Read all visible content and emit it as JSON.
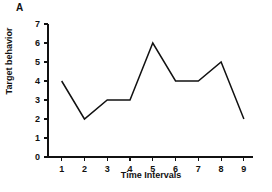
{
  "figure": {
    "panel_label": "A"
  },
  "chart_data": {
    "type": "line",
    "title": "",
    "subtitle": "",
    "xlabel": "Time Intervals",
    "ylabel": "Target behavior",
    "x": [
      1,
      2,
      3,
      4,
      5,
      6,
      7,
      8,
      9
    ],
    "values": [
      4,
      2,
      3,
      3,
      6,
      4,
      4,
      5,
      2
    ],
    "xtick_labels": [
      "1",
      "2",
      "3",
      "4",
      "5",
      "6",
      "7",
      "8",
      "9"
    ],
    "ytick_labels": [
      "0",
      "1",
      "2",
      "3",
      "4",
      "5",
      "6",
      "7"
    ],
    "ytick_values": [
      0,
      1,
      2,
      3,
      4,
      5,
      6,
      7
    ],
    "xlim": [
      0.4,
      9.4
    ],
    "ylim": [
      0,
      7
    ],
    "grid": false,
    "legend": null,
    "line_color": "#111111",
    "axis_color": "#111111",
    "background_color": "#ffffff",
    "markers": false,
    "annotations": []
  }
}
